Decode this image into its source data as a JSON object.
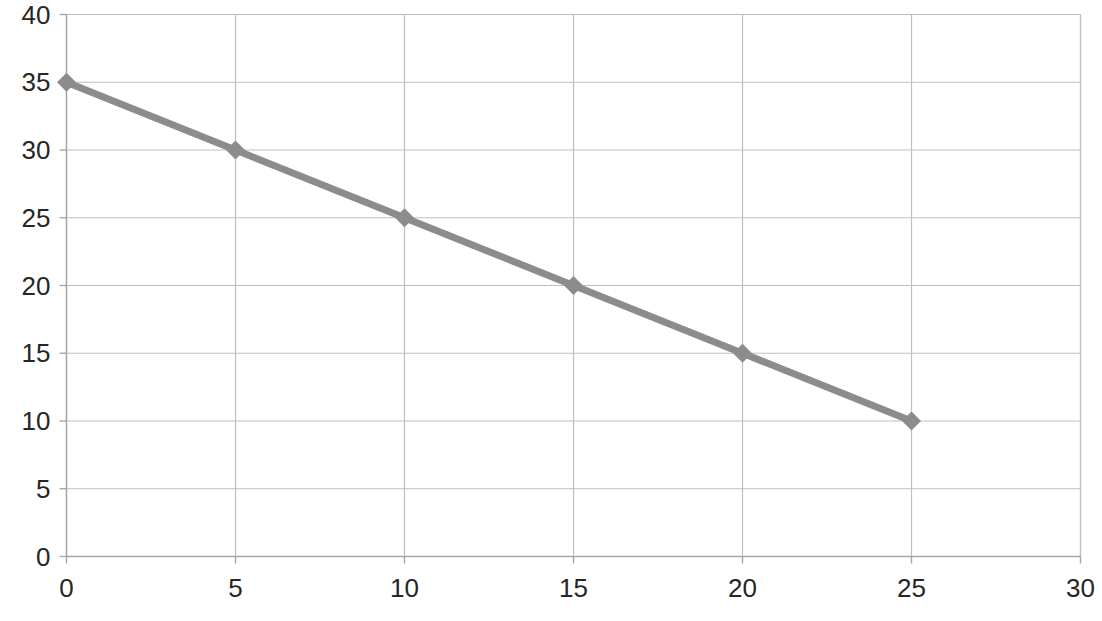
{
  "chart_data": {
    "type": "line",
    "title": "",
    "subtitle": "",
    "xlabel": "",
    "ylabel": "",
    "x": [
      0,
      5,
      10,
      15,
      20,
      25
    ],
    "values": [
      35,
      30,
      25,
      20,
      15,
      10
    ],
    "series": [
      {
        "name": "",
        "x": [
          0,
          5,
          10,
          15,
          20,
          25
        ],
        "values": [
          35,
          30,
          25,
          20,
          15,
          10
        ]
      }
    ],
    "xlim": [
      0,
      30
    ],
    "ylim": [
      0,
      40
    ],
    "xticks": [
      0,
      5,
      10,
      15,
      20,
      25,
      30
    ],
    "yticks": [
      0,
      5,
      10,
      15,
      20,
      25,
      30,
      35,
      40
    ],
    "xtick_labels": [
      "0",
      "5",
      "10",
      "15",
      "20",
      "25",
      "30"
    ],
    "ytick_labels": [
      "0",
      "5",
      "10",
      "15",
      "20",
      "25",
      "30",
      "35",
      "40"
    ],
    "grid": true,
    "grid_axes": "both",
    "legend": false,
    "legend_position": "none",
    "marker": "diamond",
    "colors": {
      "series_line": "#8C8C8C",
      "marker": "#8C8C8C",
      "gridline": "#BFBFBF",
      "axis": "#A6A6A6",
      "tick_text": "#262626",
      "background": "#FFFFFF"
    },
    "annotations": []
  },
  "axes": {
    "y_labels": [
      {
        "value": "40"
      },
      {
        "value": "35"
      },
      {
        "value": "30"
      },
      {
        "value": "25"
      },
      {
        "value": "20"
      },
      {
        "value": "15"
      },
      {
        "value": "10"
      },
      {
        "value": "5"
      },
      {
        "value": "0"
      }
    ],
    "x_labels": [
      {
        "value": "0"
      },
      {
        "value": "5"
      },
      {
        "value": "10"
      },
      {
        "value": "15"
      },
      {
        "value": "20"
      },
      {
        "value": "25"
      },
      {
        "value": "30"
      }
    ]
  }
}
